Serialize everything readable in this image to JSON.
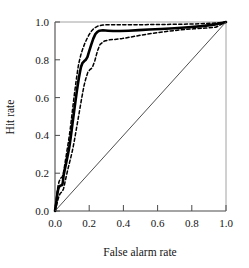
{
  "chart_data": {
    "type": "line",
    "title": "",
    "xlabel": "False alarm rate",
    "ylabel": "Hit rate",
    "xlim": [
      0.0,
      1.0
    ],
    "ylim": [
      0.0,
      1.0
    ],
    "xticks": [
      "0.0",
      "0.2",
      "0.4",
      "0.6",
      "0.8",
      "1.0"
    ],
    "yticks": [
      "0.0",
      "0.2",
      "0.4",
      "0.6",
      "0.8",
      "1.0"
    ],
    "xtick_values": [
      0.0,
      0.2,
      0.4,
      0.6,
      0.8,
      1.0
    ],
    "ytick_values": [
      0.0,
      0.2,
      0.4,
      0.6,
      0.8,
      1.0
    ],
    "grid": false,
    "legend": "none",
    "series": [
      {
        "name": "ROC curve",
        "style": "solid",
        "color": "#000000",
        "width": 2.6,
        "x": [
          0.0,
          0.005,
          0.01,
          0.014,
          0.018,
          0.022,
          0.026,
          0.03,
          0.034,
          0.038,
          0.042,
          0.046,
          0.05,
          0.056,
          0.062,
          0.068,
          0.074,
          0.08,
          0.086,
          0.092,
          0.098,
          0.104,
          0.11,
          0.116,
          0.122,
          0.128,
          0.134,
          0.14,
          0.146,
          0.152,
          0.16,
          0.17,
          0.18,
          0.19,
          0.2,
          0.212,
          0.224,
          0.236,
          0.248,
          0.26,
          0.28,
          0.31,
          0.34,
          0.38,
          0.43,
          0.49,
          0.55,
          0.62,
          0.7,
          0.78,
          0.86,
          0.93,
          0.97,
          1.0
        ],
        "y": [
          0.0,
          0.03,
          0.062,
          0.09,
          0.112,
          0.124,
          0.13,
          0.133,
          0.135,
          0.136,
          0.137,
          0.152,
          0.186,
          0.214,
          0.24,
          0.266,
          0.292,
          0.32,
          0.352,
          0.39,
          0.432,
          0.474,
          0.516,
          0.556,
          0.596,
          0.636,
          0.672,
          0.706,
          0.736,
          0.762,
          0.782,
          0.792,
          0.8,
          0.816,
          0.846,
          0.88,
          0.912,
          0.936,
          0.948,
          0.954,
          0.956,
          0.954,
          0.952,
          0.952,
          0.954,
          0.957,
          0.96,
          0.963,
          0.967,
          0.972,
          0.978,
          0.986,
          0.993,
          1.0
        ]
      },
      {
        "name": "Upper confidence band",
        "style": "dashed",
        "color": "#000000",
        "width": 1.5,
        "x": [
          0.0,
          0.006,
          0.012,
          0.018,
          0.024,
          0.03,
          0.036,
          0.042,
          0.048,
          0.054,
          0.06,
          0.066,
          0.072,
          0.078,
          0.084,
          0.09,
          0.096,
          0.102,
          0.108,
          0.114,
          0.12,
          0.126,
          0.132,
          0.138,
          0.146,
          0.154,
          0.164,
          0.174,
          0.186,
          0.2,
          0.215,
          0.23,
          0.25,
          0.28,
          0.32,
          0.38,
          0.45,
          0.53,
          0.62,
          0.72,
          0.82,
          0.91,
          0.96,
          1.0
        ],
        "y": [
          0.0,
          0.052,
          0.098,
          0.134,
          0.156,
          0.168,
          0.176,
          0.18,
          0.196,
          0.226,
          0.262,
          0.296,
          0.33,
          0.364,
          0.4,
          0.44,
          0.486,
          0.532,
          0.578,
          0.622,
          0.664,
          0.704,
          0.742,
          0.776,
          0.808,
          0.836,
          0.862,
          0.886,
          0.91,
          0.934,
          0.954,
          0.968,
          0.978,
          0.984,
          0.986,
          0.986,
          0.986,
          0.986,
          0.987,
          0.988,
          0.99,
          0.993,
          0.996,
          1.0
        ]
      },
      {
        "name": "Lower confidence band",
        "style": "dashed",
        "color": "#000000",
        "width": 1.5,
        "x": [
          0.0,
          0.006,
          0.012,
          0.018,
          0.024,
          0.03,
          0.036,
          0.042,
          0.05,
          0.058,
          0.066,
          0.074,
          0.082,
          0.09,
          0.098,
          0.106,
          0.114,
          0.122,
          0.13,
          0.138,
          0.146,
          0.154,
          0.162,
          0.17,
          0.18,
          0.192,
          0.204,
          0.218,
          0.232,
          0.248,
          0.264,
          0.29,
          0.32,
          0.35,
          0.39,
          0.44,
          0.5,
          0.57,
          0.65,
          0.73,
          0.81,
          0.88,
          0.94,
          1.0
        ],
        "y": [
          0.0,
          0.018,
          0.04,
          0.062,
          0.08,
          0.092,
          0.098,
          0.102,
          0.118,
          0.15,
          0.184,
          0.216,
          0.246,
          0.274,
          0.304,
          0.338,
          0.376,
          0.418,
          0.46,
          0.502,
          0.544,
          0.586,
          0.626,
          0.664,
          0.7,
          0.734,
          0.748,
          0.758,
          0.792,
          0.846,
          0.882,
          0.9,
          0.906,
          0.908,
          0.912,
          0.92,
          0.93,
          0.94,
          0.95,
          0.958,
          0.964,
          0.968,
          0.972,
          1.0
        ]
      },
      {
        "name": "Chance diagonal",
        "style": "solid",
        "color": "#3a3a3a",
        "width": 0.9,
        "x": [
          0.0,
          1.0
        ],
        "y": [
          0.0,
          1.0
        ]
      }
    ]
  }
}
